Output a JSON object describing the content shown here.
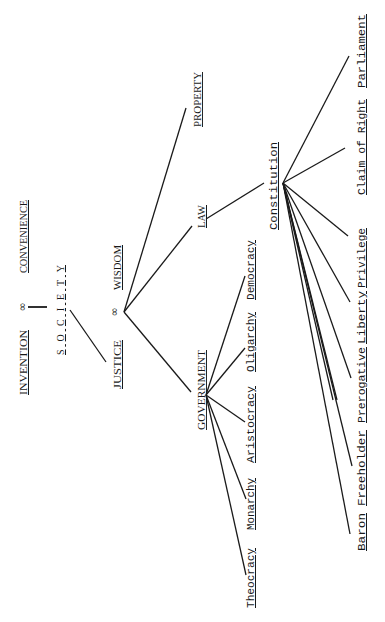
{
  "diagram": {
    "orientation": "rotated-90-ccw",
    "nodes": {
      "invention": "INVENTION",
      "convenience": "CONVENIENCE",
      "infinity_top": "∞",
      "society": "S O C I E T Y",
      "justice": "JUSTICE",
      "infinity_mid": "∞",
      "wisdom": "WISDOM",
      "property": "PROPERTY",
      "law": "LAW",
      "government": "GOVERNMENT",
      "constitution": "Constitution"
    },
    "government_children": [
      "Democracy",
      "Oligarchy",
      "Aristocracy",
      "Monarchy",
      "Theocracy"
    ],
    "constitution_children": [
      "Parliament",
      "Claim of Right",
      "Privilege",
      "Liberty",
      "Prerogative",
      "Freeholder",
      "Baron"
    ],
    "edges": [
      [
        "INVENTION ∞ CONVENIENCE",
        "SOCIETY"
      ],
      [
        "SOCIETY",
        "JUSTICE"
      ],
      [
        "JUSTICE ∞ WISDOM",
        "PROPERTY"
      ],
      [
        "JUSTICE ∞ WISDOM",
        "LAW"
      ],
      [
        "JUSTICE ∞ WISDOM",
        "GOVERNMENT"
      ],
      [
        "GOVERNMENT",
        "Democracy"
      ],
      [
        "GOVERNMENT",
        "Oligarchy"
      ],
      [
        "GOVERNMENT",
        "Aristocracy"
      ],
      [
        "GOVERNMENT",
        "Monarchy"
      ],
      [
        "GOVERNMENT",
        "Theocracy"
      ],
      [
        "LAW",
        "Constitution"
      ],
      [
        "Constitution",
        "Parliament"
      ],
      [
        "Constitution",
        "Claim of Right"
      ],
      [
        "Constitution",
        "Privilege"
      ],
      [
        "Constitution",
        "Liberty"
      ],
      [
        "Constitution",
        "Prerogative"
      ],
      [
        "Constitution",
        "Freeholder"
      ],
      [
        "Constitution",
        "Baron"
      ]
    ],
    "colors": {
      "ink": "#1a1a1a",
      "background": "#ffffff"
    }
  }
}
